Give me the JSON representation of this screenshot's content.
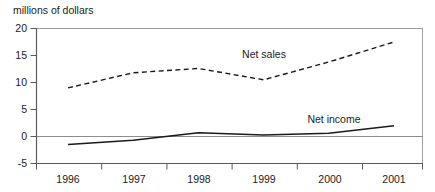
{
  "chart_data": {
    "type": "line",
    "title": "",
    "subtitle": "",
    "unit_label": "millions of dollars",
    "xlabel": "",
    "ylabel": "",
    "categories": [
      "1996",
      "1997",
      "1998",
      "1999",
      "2000",
      "2001"
    ],
    "x": [
      1996,
      1997,
      1998,
      1999,
      2000,
      2001
    ],
    "ylim": [
      -5,
      20
    ],
    "yticks": [
      -5,
      0,
      5,
      10,
      15,
      20
    ],
    "ytick_labels": [
      "-5",
      "0",
      "5",
      "10",
      "15",
      "20"
    ],
    "xtick_labels": [
      "1996",
      "1997",
      "1998",
      "1999",
      "2000",
      "2001"
    ],
    "grid": false,
    "zero_line": true,
    "legend_position": "inline-annotation",
    "series": [
      {
        "name": "Net sales",
        "style": "dashed",
        "color": "#1a1a1a",
        "values": [
          9,
          11.8,
          12.6,
          10.5,
          13.8,
          17.5
        ],
        "annotation": "Net sales"
      },
      {
        "name": "Net income",
        "style": "solid",
        "color": "#1a1a1a",
        "values": [
          -1.5,
          -0.7,
          0.7,
          0.3,
          0.6,
          2.0
        ],
        "annotation": "Net income"
      }
    ],
    "annotations": [
      {
        "text": "Net sales",
        "x": 1999.0,
        "y": 14.2
      },
      {
        "text": "Net income",
        "x": 2000.3,
        "y": 3.6
      }
    ],
    "axis_color": "#6b6b6b",
    "plot_border_color": "#9a9a9a",
    "background": "#ffffff"
  }
}
